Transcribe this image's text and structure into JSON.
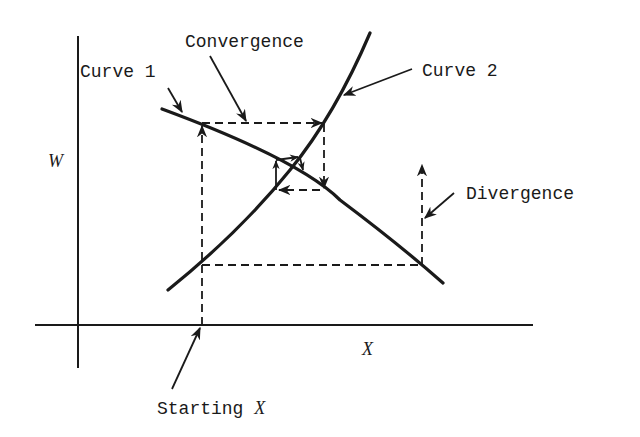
{
  "diagram": {
    "type": "cobweb iteration diagram",
    "axes": {
      "y_label": "W",
      "x_label": "X"
    },
    "labels": {
      "curve1": "Curve 1",
      "curve2": "Curve 2",
      "convergence": "Convergence",
      "divergence": "Divergence",
      "starting_x_prefix": "Starting ",
      "starting_x_var": "X"
    },
    "colors": {
      "ink": "#1a1a1a",
      "background": "#ffffff"
    }
  }
}
